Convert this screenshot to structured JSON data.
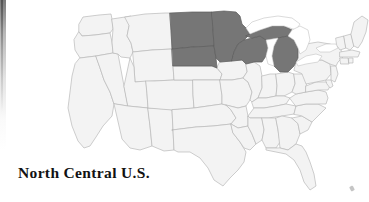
{
  "figure": {
    "caption": "North Central U.S.",
    "background_color": "#ffffff",
    "caption_color": "#121212"
  },
  "map": {
    "region_title": "North Central U.S.",
    "country": "United States",
    "projection_note": "contiguous 48 states",
    "colors": {
      "highlight_fill": "#767676",
      "highlight_stroke": "#5d5d5d",
      "plain_fill": "#f3f3f3",
      "plain_stroke": "#b9b9b9",
      "lake_fill": "#ffffff"
    },
    "highlighted_states": [
      "North Dakota",
      "South Dakota",
      "Minnesota",
      "Wisconsin",
      "Michigan"
    ],
    "plain_states": [
      "Washington",
      "Oregon",
      "California",
      "Nevada",
      "Idaho",
      "Montana",
      "Wyoming",
      "Utah",
      "Arizona",
      "New Mexico",
      "Colorado",
      "Nebraska",
      "Kansas",
      "Oklahoma",
      "Texas",
      "Iowa",
      "Missouri",
      "Arkansas",
      "Louisiana",
      "Illinois",
      "Indiana",
      "Ohio",
      "Kentucky",
      "Tennessee",
      "Mississippi",
      "Alabama",
      "Georgia",
      "Florida",
      "South Carolina",
      "North Carolina",
      "Virginia",
      "West Virginia",
      "Maryland",
      "Delaware",
      "Pennsylvania",
      "New Jersey",
      "New York",
      "Connecticut",
      "Rhode Island",
      "Massachusetts",
      "Vermont",
      "New Hampshire",
      "Maine"
    ],
    "lakes": [
      "Lake Superior",
      "Lake Michigan",
      "Lake Huron",
      "Lake Erie",
      "Lake Ontario"
    ]
  },
  "artifacts": {
    "left_edge_streak": "scan-shadow",
    "corner_speck": "scan-speck"
  }
}
